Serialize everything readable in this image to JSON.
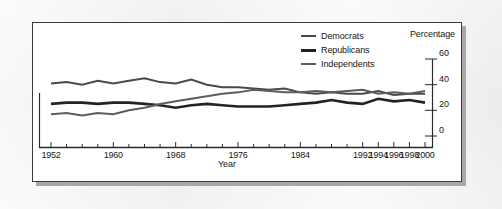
{
  "figure": {
    "panel_background": "#ffffff",
    "outer_background": "#f2f1ef",
    "border_color": "#3b3b3b"
  },
  "chart_data": {
    "type": "line",
    "title": "",
    "xlabel": "Year",
    "ylabel": "Percentage",
    "ylim": [
      0,
      60
    ],
    "yticks": [
      0,
      20,
      40,
      60
    ],
    "grid": false,
    "legend_position": "top-right",
    "xtick_labels": [
      "1952",
      "1960",
      "1968",
      "1976",
      "1984",
      "1992",
      "1994",
      "1996",
      "1998",
      "2000"
    ],
    "x": [
      1952,
      1954,
      1956,
      1958,
      1960,
      1962,
      1964,
      1966,
      1968,
      1970,
      1972,
      1974,
      1976,
      1978,
      1980,
      1982,
      1984,
      1986,
      1988,
      1990,
      1992,
      1994,
      1996,
      1998,
      2000
    ],
    "series": [
      {
        "name": "Democrats",
        "color": "#4a4a4a",
        "width": 2.0,
        "values": [
          41,
          42,
          40,
          43,
          41,
          43,
          45,
          42,
          41,
          44,
          40,
          38,
          38,
          37,
          36,
          37,
          34,
          33,
          34,
          33,
          33,
          35,
          32,
          33,
          33
        ]
      },
      {
        "name": "Republicans",
        "color": "#232323",
        "width": 2.6,
        "values": [
          25,
          26,
          26,
          25,
          26,
          26,
          25,
          24,
          22,
          24,
          25,
          24,
          23,
          23,
          23,
          24,
          25,
          26,
          28,
          26,
          25,
          29,
          27,
          28,
          26
        ]
      },
      {
        "name": "Independents",
        "color": "#5d5d5d",
        "width": 2.0,
        "values": [
          17,
          18,
          16,
          18,
          17,
          20,
          22,
          25,
          27,
          29,
          31,
          33,
          34,
          36,
          35,
          34,
          34,
          35,
          34,
          35,
          36,
          33,
          34,
          33,
          35
        ]
      }
    ]
  },
  "legend": {
    "items": [
      {
        "label": "Democrats"
      },
      {
        "label": "Republicans"
      },
      {
        "label": "Independents"
      }
    ]
  },
  "axes": {
    "y_title": "Percentage",
    "x_title": "Year"
  }
}
